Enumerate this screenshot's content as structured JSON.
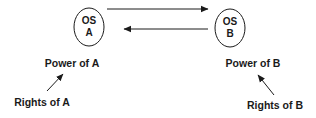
{
  "diagram": {
    "nodes": [
      {
        "id": "os_a",
        "line1": "OS",
        "line2": "A",
        "cx": 89,
        "cy": 27,
        "rx": 15,
        "ry": 19
      },
      {
        "id": "os_b",
        "line1": "OS",
        "line2": "B",
        "cx": 230,
        "cy": 28,
        "rx": 15,
        "ry": 19
      }
    ],
    "edges": [
      {
        "from": "os_a",
        "to": "os_b",
        "direction": "right",
        "x1": 107,
        "y1": 9,
        "x2": 208,
        "y2": 9
      },
      {
        "from": "os_b",
        "to": "os_a",
        "direction": "left",
        "x1": 208,
        "y1": 29,
        "x2": 123,
        "y2": 29
      }
    ],
    "labels": {
      "power_a": "Power of A",
      "power_b": "Power of B",
      "rights_a": "Rights of A",
      "rights_b": "Rights of B"
    },
    "pointer_edges": [
      {
        "from": "rights_a",
        "to": "power_a"
      },
      {
        "from": "rights_b",
        "to": "power_b"
      }
    ]
  }
}
